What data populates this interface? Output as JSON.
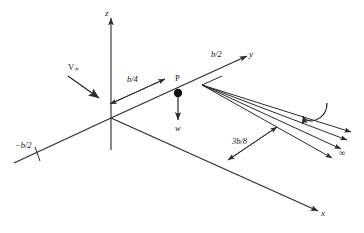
{
  "figure": {
    "stroke_color": "#2b2b2b",
    "text_color": "#1a1a1a",
    "background": "#ffffff"
  },
  "axes": [
    {
      "name": "z-axis",
      "label": "z",
      "direction": "up"
    },
    {
      "name": "y-axis",
      "label": "y",
      "direction": "up-right"
    },
    {
      "name": "x-axis",
      "label": "x",
      "direction": "down-right"
    }
  ],
  "labels": {
    "z_axis": "z",
    "y_axis": "y",
    "x_axis": "x",
    "freestream_velocity": "V",
    "freestream_subscript": "∞",
    "half_span_positive": "b/2",
    "half_span_negative": "−b/2",
    "quarter_span": "b/4",
    "three_eighths_span": "3b/8",
    "point": "P",
    "downwash": "w",
    "infinity": "∞"
  },
  "dimensions": {
    "quarter_span": {
      "value": "b/4",
      "from": "z-axis",
      "to": "point P",
      "style": "double-arrow"
    },
    "three_eighths_span": {
      "value": "3b/8",
      "from": "x-axis",
      "to": "vortex-sheet",
      "style": "double-arrow"
    }
  },
  "point_P": {
    "label": "P",
    "marker": "filled-circle",
    "downwash_label": "w",
    "downwash_direction": "downward"
  },
  "vortex_sheet": {
    "line_count": 4,
    "direction": "downstream",
    "end_label": "∞",
    "circulation_arrow": "curved-clockwise"
  },
  "tick_marks": [
    {
      "name": "negative-half-span-tick",
      "label": "−b/2"
    }
  ]
}
